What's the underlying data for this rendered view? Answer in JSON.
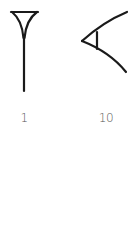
{
  "diagram": {
    "title": "",
    "stroke_color": "#1a1a1a",
    "label_color": "#555555",
    "symbols": [
      {
        "name": "vertical-wedge",
        "value_label": "1"
      },
      {
        "name": "corner-wedge",
        "value_label": "10"
      }
    ]
  }
}
